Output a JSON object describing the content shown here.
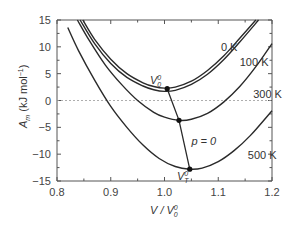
{
  "chart_data": {
    "type": "line",
    "title": "",
    "xlabel": "V / V0^0",
    "ylabel": "A_m (kJ mol^-1)",
    "xlim": [
      0.8,
      1.2
    ],
    "ylim": [
      -15,
      15
    ],
    "x_ticks": [
      "0.8",
      "0.9",
      "1.0",
      "1.1",
      "1.2"
    ],
    "y_ticks": [
      "15",
      "10",
      "5",
      "0",
      "-5",
      "-10",
      "-15"
    ],
    "grid": false,
    "reference_line": {
      "y": 0,
      "style": "dashed"
    },
    "series": [
      {
        "name": "0 K",
        "label": "0 K",
        "x": [
          0.848,
          0.87,
          0.9,
          0.93,
          0.96,
          0.98,
          1.0,
          1.02,
          1.05,
          1.08,
          1.11,
          1.14,
          1.17
        ],
        "y": [
          15,
          11.4,
          7.7,
          5.0,
          3.3,
          2.6,
          2.3,
          2.5,
          3.6,
          5.6,
          8.3,
          11.6,
          15
        ]
      },
      {
        "name": "100 K",
        "label": "100 K",
        "x": [
          0.843,
          0.87,
          0.9,
          0.93,
          0.96,
          0.98,
          1.0,
          1.02,
          1.05,
          1.08,
          1.11,
          1.14,
          1.175
        ],
        "y": [
          15,
          10.6,
          6.9,
          4.3,
          2.7,
          2.0,
          1.7,
          1.9,
          3.0,
          4.9,
          7.6,
          10.9,
          15
        ]
      },
      {
        "name": "300 K",
        "label": "300 K",
        "x": [
          0.838,
          0.86,
          0.89,
          0.92,
          0.95,
          0.98,
          1.0,
          1.027,
          1.05,
          1.08,
          1.11,
          1.14,
          1.17,
          1.2
        ],
        "y": [
          15,
          11.2,
          6.6,
          3.0,
          0.0,
          -2.2,
          -3.1,
          -3.7,
          -3.5,
          -2.4,
          -0.3,
          2.6,
          6.3,
          10.6
        ]
      },
      {
        "name": "500 K",
        "label": "500 K",
        "x": [
          0.82,
          0.84,
          0.87,
          0.9,
          0.93,
          0.96,
          0.99,
          1.02,
          1.047,
          1.07,
          1.1,
          1.13,
          1.16,
          1.2
        ],
        "y": [
          13.6,
          9.3,
          3.8,
          -1.1,
          -5.0,
          -8.3,
          -10.8,
          -12.3,
          -12.8,
          -12.6,
          -11.4,
          -9.3,
          -6.5,
          -1.9
        ]
      }
    ],
    "equilibrium_path": {
      "label": "p = 0",
      "points": [
        {
          "x": 1.005,
          "y": 2.2,
          "label": "V_0^0"
        },
        {
          "x": 1.027,
          "y": -3.7,
          "label": ""
        },
        {
          "x": 1.047,
          "y": -12.8,
          "label": "V_T^0"
        }
      ]
    },
    "annotations": [
      {
        "text": "0 K",
        "x": 1.105,
        "y": 10.0
      },
      {
        "text": "100 K",
        "x": 1.14,
        "y": 7.2
      },
      {
        "text": "300 K",
        "x": 1.165,
        "y": 1.2
      },
      {
        "text": "500 K",
        "x": 1.155,
        "y": -10.2
      },
      {
        "text": "p = 0",
        "x": 1.05,
        "y": -7.6
      }
    ]
  },
  "labels": {
    "x_axis_title_main": "V / V",
    "x_axis_title_sup": "0",
    "x_axis_title_sub": "0",
    "y_axis_title_main": "A",
    "y_axis_title_sub": "m",
    "y_axis_title_rest": " (kJ mol",
    "y_axis_title_sup": "−1",
    "y_axis_title_end": ")",
    "v00_main": "V",
    "v00_sup": "0",
    "v00_sub": "0",
    "vt0_main": "V",
    "vt0_sup": "0",
    "vt0_sub": "T",
    "p0": "p = 0"
  },
  "colors": {
    "curve": "#2a2a2a",
    "axis": "#555555",
    "dashed": "#999999",
    "text": "#333333"
  }
}
